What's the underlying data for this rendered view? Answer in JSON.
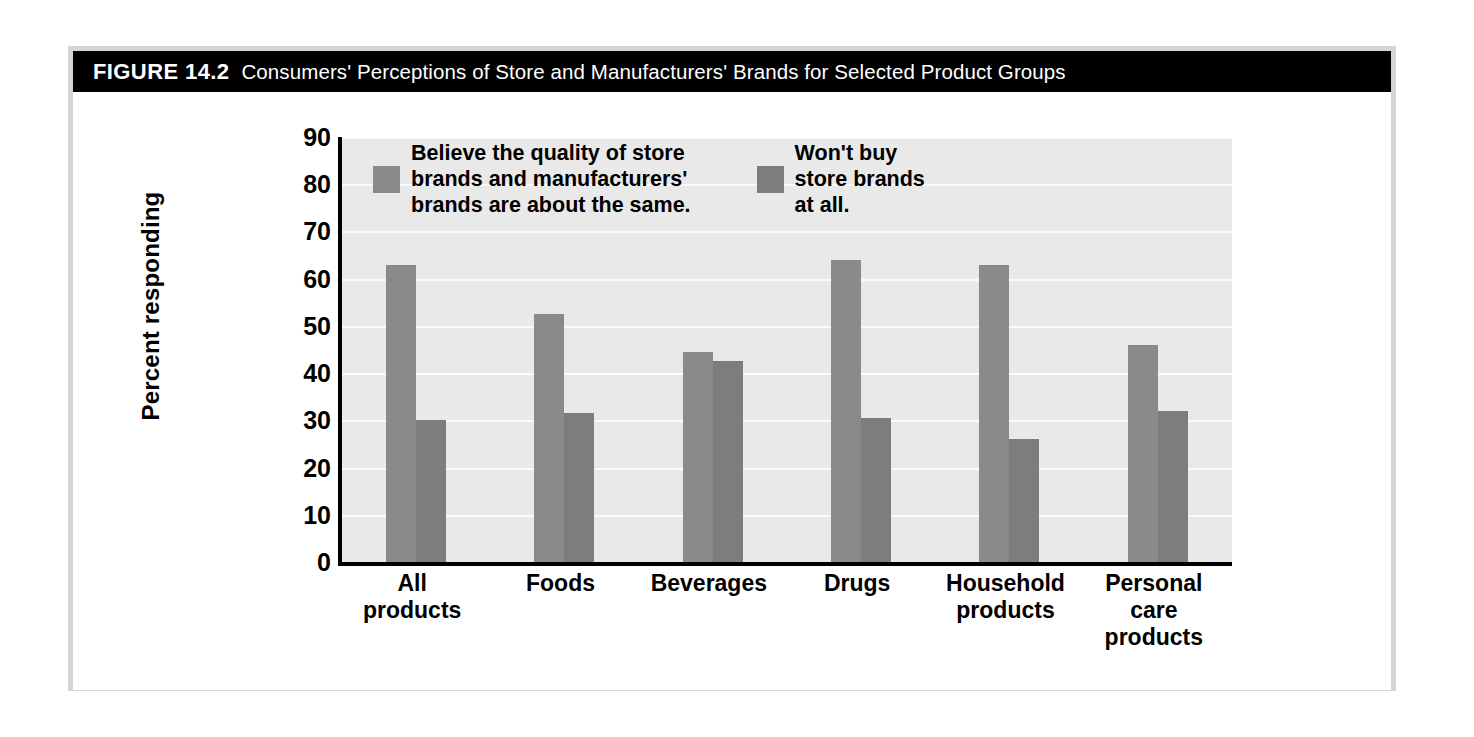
{
  "figure": {
    "label": "FIGURE 14.2",
    "title": "Consumers' Perceptions of Store and Manufacturers' Brands for Selected Product Groups"
  },
  "colors": {
    "banner_background": "#000000",
    "banner_text": "#ffffff",
    "frame_border": "#d5d5d5",
    "plot_background": "#e9e9e9",
    "gridline": "#fbfbfb",
    "series_1": "#8a8a8a",
    "series_2": "#7d7d7d",
    "axis": "#000000"
  },
  "chart_data": {
    "type": "bar",
    "title": "Consumers' Perceptions of Store and Manufacturers' Brands for Selected Product Groups",
    "xlabel": "",
    "ylabel": "Percent responding",
    "ylim": [
      0,
      90
    ],
    "ytick_step": 10,
    "yticks": [
      90,
      80,
      70,
      60,
      50,
      40,
      30,
      20,
      10,
      0
    ],
    "grid": true,
    "legend_position": "top-center",
    "categories": [
      "All\nproducts",
      "Foods",
      "Beverages",
      "Drugs",
      "Household\nproducts",
      "Personal\ncare\nproducts"
    ],
    "series": [
      {
        "name": "Believe the quality of store brands and manufacturers' brands are about the same.",
        "legend_label": "Believe the quality of store\nbrands and manufacturers'\nbrands are about the same.",
        "color": "#8a8a8a",
        "values": [
          63,
          52.5,
          44.5,
          64,
          63,
          46
        ]
      },
      {
        "name": "Won't buy store brands at all.",
        "legend_label": "Won't buy\nstore brands\nat all.",
        "color": "#7d7d7d",
        "values": [
          30,
          31.5,
          42.5,
          30.5,
          26,
          32
        ]
      }
    ]
  }
}
